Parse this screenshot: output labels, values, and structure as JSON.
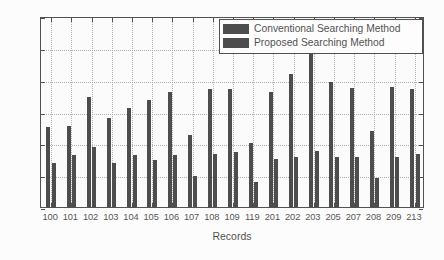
{
  "chart_data": {
    "type": "bar",
    "title": "",
    "xlabel": "Records",
    "ylabel": "Computational Time (s)",
    "categories": [
      "100",
      "101",
      "102",
      "103",
      "104",
      "105",
      "106",
      "107",
      "108",
      "109",
      "119",
      "201",
      "202",
      "203",
      "205",
      "207",
      "208",
      "209",
      "213"
    ],
    "series": [
      {
        "name": "Conventional Searching Method",
        "color": "#141414",
        "values": [
          2.52,
          2.53,
          3.45,
          2.79,
          3.1,
          3.37,
          3.62,
          2.26,
          3.7,
          3.7,
          2.02,
          3.62,
          4.17,
          4.96,
          3.92,
          3.73,
          2.38,
          3.76,
          3.72
        ]
      },
      {
        "name": "Proposed Searching Method",
        "color": "#141414",
        "values": [
          1.38,
          1.62,
          1.87,
          1.39,
          1.62,
          1.47,
          1.63,
          0.99,
          1.66,
          1.73,
          0.8,
          1.52,
          1.58,
          1.77,
          1.57,
          1.58,
          0.92,
          1.56,
          1.67
        ]
      }
    ],
    "ylim": [
      0,
      6
    ],
    "yticks": [
      0,
      1,
      2,
      3,
      4,
      5,
      6
    ],
    "ytick_labels": [
      "0",
      "1",
      "2",
      "3",
      "4",
      "5",
      "6"
    ],
    "grid": true,
    "grid_style": "dotted",
    "legend_position": "top-right",
    "legend_entries": [
      "Conventional Searching Method",
      "Proposed Searching Method"
    ]
  },
  "legend": {
    "entries": [
      {
        "label": "Conventional Searching Method"
      },
      {
        "label": "Proposed Searching Method"
      }
    ]
  },
  "axes": {
    "ylabel": "Computational Time (s)",
    "xlabel": "Records"
  }
}
